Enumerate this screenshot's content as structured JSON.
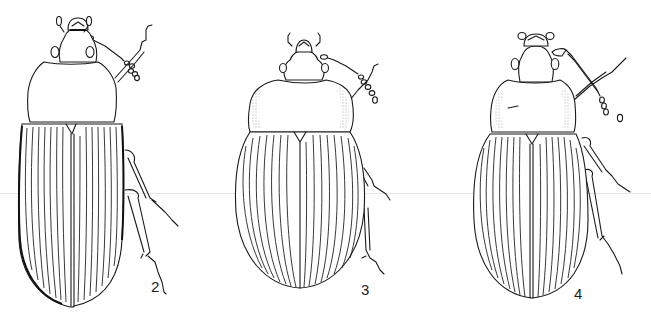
{
  "plate": {
    "background": "#ffffff",
    "ink_color": "#1a1a1a",
    "figures": [
      {
        "label": "2",
        "subject": "beetle-dorsal-view",
        "shape": "elongate-parallel"
      },
      {
        "label": "3",
        "subject": "beetle-dorsal-view",
        "shape": "broad-oval"
      },
      {
        "label": "4",
        "subject": "beetle-dorsal-view",
        "shape": "oval-elongate"
      }
    ]
  }
}
